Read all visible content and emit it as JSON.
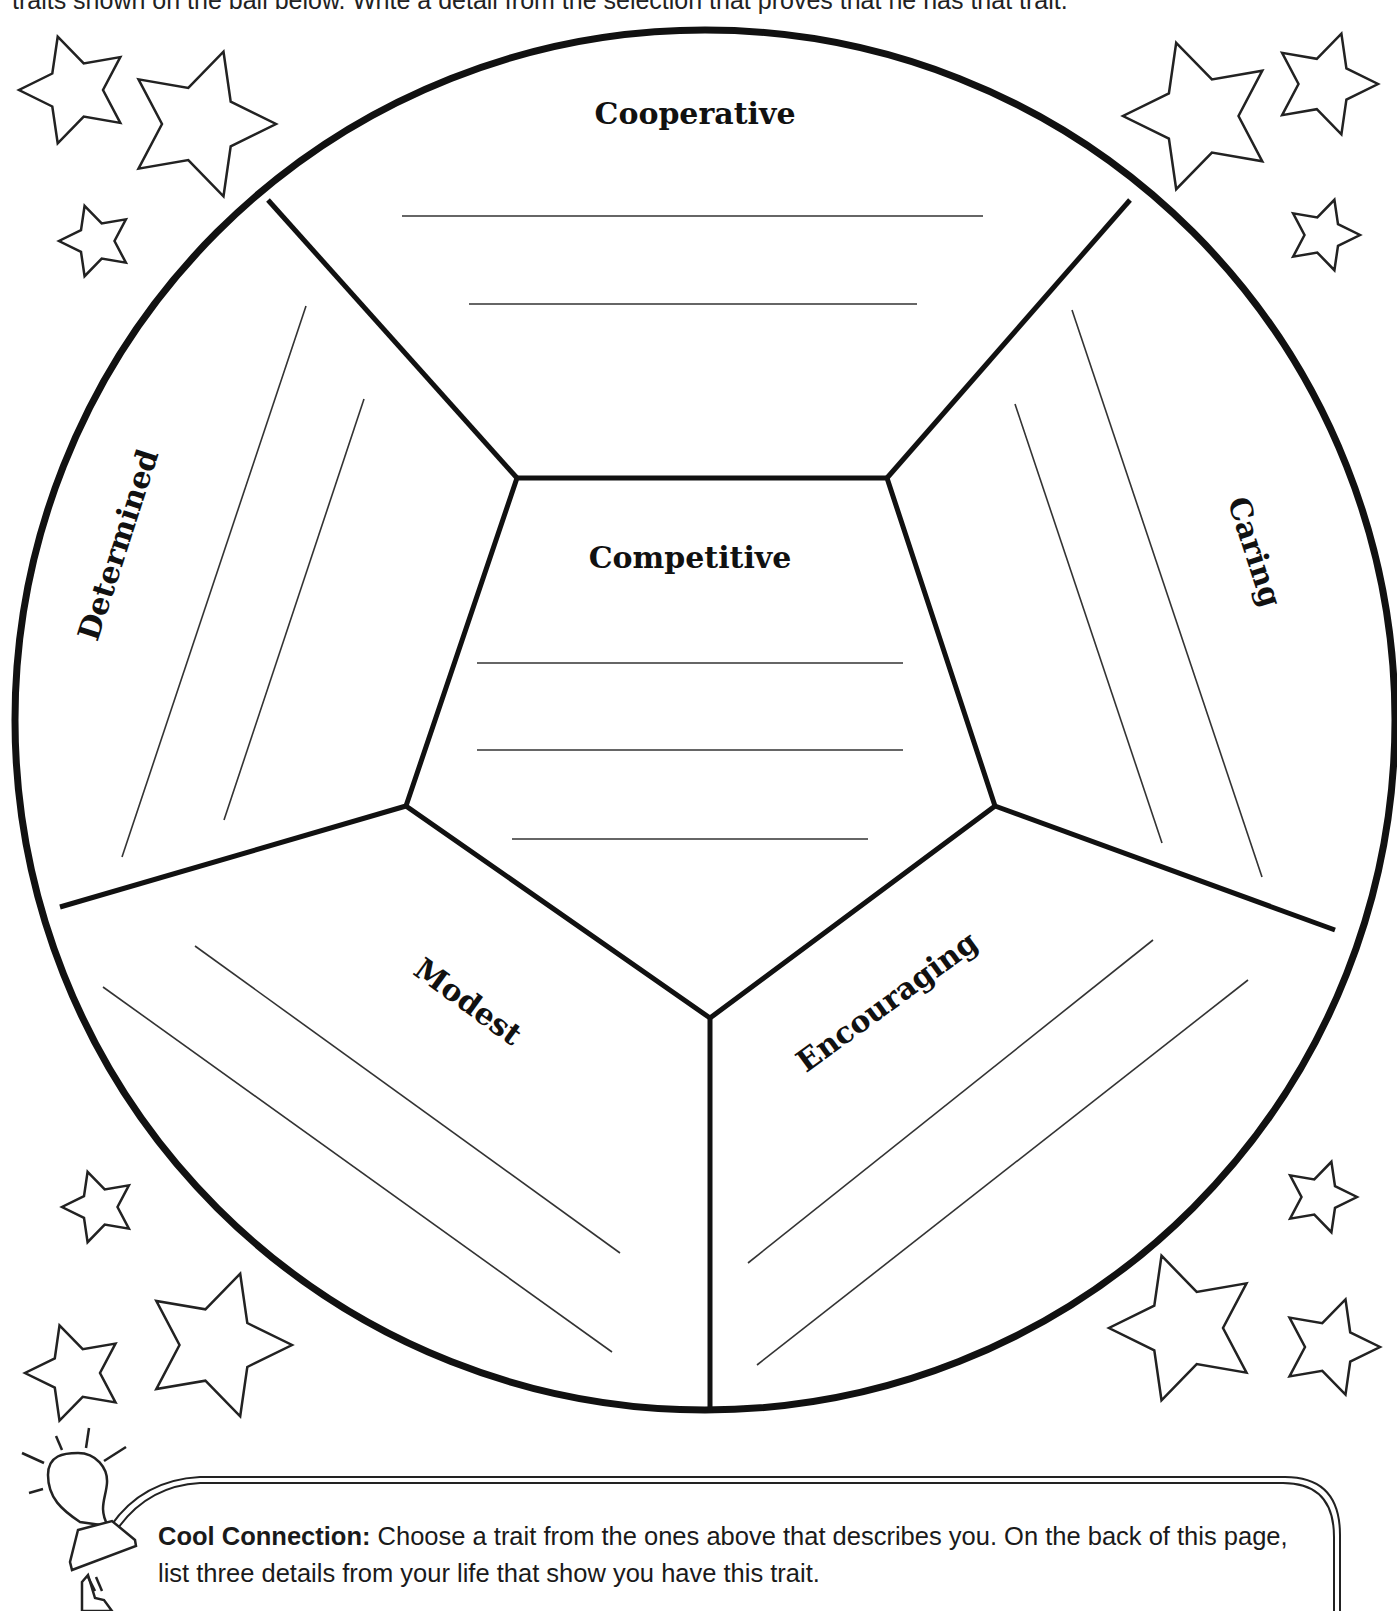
{
  "page": {
    "instruction_partial": "traits shown on the ball below. Write a detail from the selection that proves that he has that trait."
  },
  "ball": {
    "center": [
      705,
      720
    ],
    "radius": 690,
    "stroke_color": "#111111",
    "pentagon": [
      [
        517,
        478
      ],
      [
        887,
        478
      ],
      [
        995,
        806
      ],
      [
        710,
        1018
      ],
      [
        406,
        806
      ]
    ],
    "outer_points": [
      [
        268,
        200
      ],
      [
        1130,
        200
      ],
      [
        1335,
        930
      ],
      [
        710,
        1413
      ],
      [
        60,
        907
      ]
    ]
  },
  "traits": [
    {
      "id": "cooperative",
      "label": "Cooperative",
      "x": 695,
      "y": 124,
      "rotate": 0
    },
    {
      "id": "competitive",
      "label": "Competitive",
      "x": 690,
      "y": 568,
      "rotate": 0
    },
    {
      "id": "determined",
      "label": "Determined",
      "x": 128,
      "y": 548,
      "rotate": -72
    },
    {
      "id": "caring",
      "label": "Caring",
      "x": 1245,
      "y": 555,
      "rotate": 72
    },
    {
      "id": "modest",
      "label": "Modest",
      "x": 462,
      "y": 1010,
      "rotate": 36
    },
    {
      "id": "encouraging",
      "label": "Encouraging",
      "x": 893,
      "y": 1010,
      "rotate": -36
    }
  ],
  "writing_lines": {
    "cooperative": [
      [
        402,
        216,
        983,
        216
      ],
      [
        469,
        304,
        917,
        304
      ]
    ],
    "competitive": [
      [
        477,
        663,
        903,
        663
      ],
      [
        477,
        750,
        903,
        750
      ],
      [
        512,
        839,
        868,
        839
      ]
    ],
    "determined": [
      [
        306,
        306,
        122,
        857
      ],
      [
        364,
        399,
        224,
        820
      ]
    ],
    "caring": [
      [
        1072,
        310,
        1262,
        877
      ],
      [
        1015,
        404,
        1162,
        843
      ]
    ],
    "modest": [
      [
        195,
        946,
        620,
        1253
      ],
      [
        103,
        987,
        612,
        1352
      ]
    ],
    "encouraging": [
      [
        1153,
        940,
        748,
        1263
      ],
      [
        1248,
        980,
        757,
        1365
      ]
    ]
  },
  "stars": [
    {
      "cx": 75,
      "cy": 90,
      "r": 56,
      "rot": -18
    },
    {
      "cx": 200,
      "cy": 124,
      "r": 76,
      "rot": 18
    },
    {
      "cx": 96,
      "cy": 241,
      "r": 37,
      "rot": -18
    },
    {
      "cx": 1200,
      "cy": 116,
      "r": 77,
      "rot": -18
    },
    {
      "cx": 1325,
      "cy": 84,
      "r": 53,
      "rot": 18
    },
    {
      "cx": 1323,
      "cy": 235,
      "r": 37,
      "rot": 18
    },
    {
      "cx": 99,
      "cy": 1207,
      "r": 37,
      "rot": -18
    },
    {
      "cx": 217,
      "cy": 1345,
      "r": 75,
      "rot": 18
    },
    {
      "cx": 75,
      "cy": 1373,
      "r": 50,
      "rot": -18
    },
    {
      "cx": 1320,
      "cy": 1197,
      "r": 37,
      "rot": 18
    },
    {
      "cx": 1185,
      "cy": 1328,
      "r": 76,
      "rot": -18
    },
    {
      "cx": 1330,
      "cy": 1347,
      "r": 50,
      "rot": 18
    }
  ],
  "cool_connection": {
    "title": "Cool Connection:",
    "body": " Choose a trait from the ones above that describes you. On the back of this page, list three details from your life that show you have this trait.",
    "icon": "lightbulb-plug-icon"
  }
}
